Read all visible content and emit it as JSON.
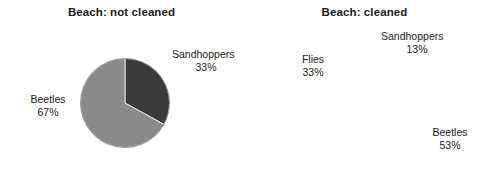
{
  "chart_data": [
    {
      "type": "pie",
      "title": "Beach: not cleaned",
      "categories": [
        "Sandhoppers",
        "Beetles"
      ],
      "values": [
        33,
        67
      ],
      "unit": "%",
      "labels": [
        "33%",
        "67%"
      ],
      "colors": [
        "#3a3a3a",
        "#8a8a8a"
      ],
      "start_angle_deg": 0,
      "direction": "clockwise",
      "legend": "none",
      "grid": false
    },
    {
      "type": "pie",
      "title": "Beach: cleaned",
      "categories": [
        "Sandhoppers",
        "Beetles",
        "Flies"
      ],
      "values": [
        13,
        53,
        33
      ],
      "unit": "%",
      "labels": [
        "13%",
        "53%",
        "33%"
      ],
      "colors": [
        "#3a3a3a",
        "#808080",
        "#b3b3b3"
      ],
      "start_angle_deg": 0,
      "direction": "clockwise",
      "legend": "none",
      "grid": false
    }
  ],
  "figure": {
    "background": "#ffffff",
    "text_color": "#1a1a1a"
  },
  "left_chart": {
    "title": "Beach: not cleaned",
    "slices": [
      {
        "name": "Sandhoppers",
        "percent_label": "33%",
        "value": 33,
        "color": "#3a3a3a"
      },
      {
        "name": "Beetles",
        "percent_label": "67%",
        "value": 67,
        "color": "#8a8a8a"
      }
    ]
  },
  "right_chart": {
    "title": "Beach: cleaned",
    "slices": [
      {
        "name": "Sandhoppers",
        "percent_label": "13%",
        "value": 13,
        "color": "#3a3a3a"
      },
      {
        "name": "Beetles",
        "percent_label": "53%",
        "value": 53,
        "color": "#808080"
      },
      {
        "name": "Flies",
        "percent_label": "33%",
        "value": 33,
        "color": "#b3b3b3"
      }
    ]
  }
}
